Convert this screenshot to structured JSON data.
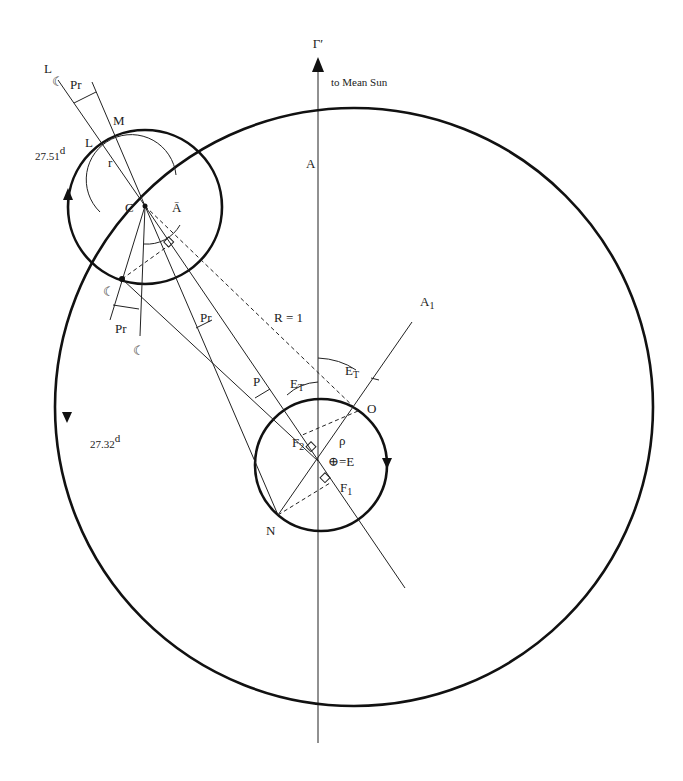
{
  "diagram": {
    "direction_label": "to Mean Sun",
    "axis_label": "Γ′",
    "labels": {
      "moon_mean_L": "L",
      "moon_glyph": "☾",
      "pr_top": "Pr",
      "M": "M",
      "L": "L",
      "r": "r",
      "C": "C",
      "A_bar": "Ā",
      "A": "A",
      "A1": "A",
      "A1_sub": "1",
      "period_epicycle": "27.51",
      "period_epicycle_unit": "d",
      "period_deferent": "27.32",
      "period_deferent_unit": "d",
      "moon_point": "☾",
      "pr_bottom": "Pr",
      "moon_bar_bottom": "☾",
      "pr_mid": "Pr",
      "R": "R = 1",
      "P": "P",
      "ET_left": "E",
      "ET_left_sub": "T",
      "ET_right": "E",
      "ET_right_sub": "T",
      "O": "O",
      "rho": "ρ",
      "F2": "F",
      "F2_sub": "2",
      "F1": "F",
      "F1_sub": "1",
      "earth": "⊕=E",
      "N": "N"
    },
    "geometry": {
      "deferent": {
        "cx": 354,
        "cy": 407,
        "r": 299
      },
      "epicycle": {
        "cx": 145,
        "cy": 207,
        "r": 77
      },
      "earth_circle": {
        "cx": 321,
        "cy": 465,
        "r": 66
      },
      "center_C": [
        145,
        206
      ],
      "earth_E": [
        318,
        461
      ],
      "moon_point": [
        122,
        279
      ],
      "point_O": [
        358,
        411
      ],
      "point_N": [
        278,
        515
      ]
    }
  }
}
